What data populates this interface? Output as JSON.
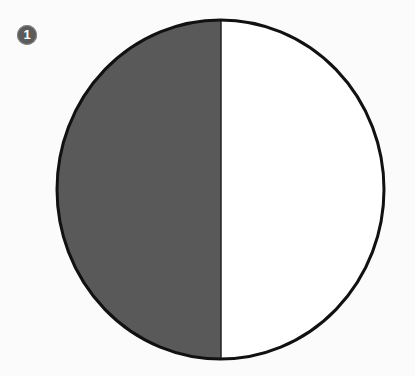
{
  "figure": {
    "badge_number": "1",
    "shape": "circle divided vertically into two equal halves",
    "left_half_fill": "#595959",
    "right_half_fill": "#ffffff",
    "outline_color": "#111111",
    "shaded_fraction": "1/2"
  }
}
